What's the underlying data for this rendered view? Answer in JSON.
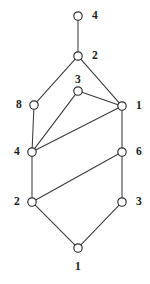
{
  "figure": {
    "type": "undirected-graph-diagram",
    "width": 150,
    "height": 284,
    "background_color": "#ffffff",
    "node_fill_color": "#ffffff",
    "node_stroke_color": "#2e2e2e",
    "edge_color": "#3a3a3a",
    "label_color": "#1c1c1c",
    "node_radius": 4.2
  },
  "nodes": [
    {
      "id": "n-top",
      "label": "4",
      "x": 78,
      "y": 16,
      "label_x": 92,
      "label_y": 10,
      "label_side": "right"
    },
    {
      "id": "n-upper",
      "label": "2",
      "x": 78,
      "y": 56,
      "label_x": 92,
      "label_y": 50,
      "label_side": "right"
    },
    {
      "id": "n-mid-top",
      "label": "3",
      "x": 78,
      "y": 91,
      "label_x": 75,
      "label_y": 74,
      "label_side": "above"
    },
    {
      "id": "n-left-upper",
      "label": "8",
      "x": 34,
      "y": 105,
      "label_x": 16,
      "label_y": 99,
      "label_side": "left"
    },
    {
      "id": "n-right-upper",
      "label": "1",
      "x": 122,
      "y": 106,
      "label_x": 136,
      "label_y": 100,
      "label_side": "right"
    },
    {
      "id": "n-left-mid",
      "label": "4",
      "x": 32,
      "y": 152,
      "label_x": 14,
      "label_y": 146,
      "label_side": "left"
    },
    {
      "id": "n-right-mid",
      "label": "6",
      "x": 122,
      "y": 152,
      "label_x": 136,
      "label_y": 146,
      "label_side": "right"
    },
    {
      "id": "n-left-lower",
      "label": "2",
      "x": 32,
      "y": 202,
      "label_x": 14,
      "label_y": 196,
      "label_side": "left"
    },
    {
      "id": "n-right-lower",
      "label": "3",
      "x": 122,
      "y": 202,
      "label_x": 136,
      "label_y": 196,
      "label_side": "right"
    },
    {
      "id": "n-bottom",
      "label": "1",
      "x": 78,
      "y": 248,
      "label_x": 75,
      "label_y": 261,
      "label_side": "below"
    }
  ],
  "edges": [
    {
      "id": "e-top-upper",
      "from": "n-top",
      "to": "n-upper"
    },
    {
      "id": "e-upper-left-upper",
      "from": "n-upper",
      "to": "n-left-upper"
    },
    {
      "id": "e-upper-right-upper",
      "from": "n-upper",
      "to": "n-right-upper"
    },
    {
      "id": "e-mid-top-right-upper",
      "from": "n-mid-top",
      "to": "n-right-upper"
    },
    {
      "id": "e-mid-top-left-mid",
      "from": "n-mid-top",
      "to": "n-left-mid"
    },
    {
      "id": "e-left-upper-left-mid",
      "from": "n-left-upper",
      "to": "n-left-mid"
    },
    {
      "id": "e-right-upper-left-mid",
      "from": "n-right-upper",
      "to": "n-left-mid"
    },
    {
      "id": "e-right-upper-right-mid",
      "from": "n-right-upper",
      "to": "n-right-mid"
    },
    {
      "id": "e-left-mid-left-lower",
      "from": "n-left-mid",
      "to": "n-left-lower"
    },
    {
      "id": "e-right-mid-left-lower",
      "from": "n-right-mid",
      "to": "n-left-lower"
    },
    {
      "id": "e-right-mid-right-lower",
      "from": "n-right-mid",
      "to": "n-right-lower"
    },
    {
      "id": "e-left-lower-bottom",
      "from": "n-left-lower",
      "to": "n-bottom"
    },
    {
      "id": "e-right-lower-bottom",
      "from": "n-right-lower",
      "to": "n-bottom"
    }
  ]
}
